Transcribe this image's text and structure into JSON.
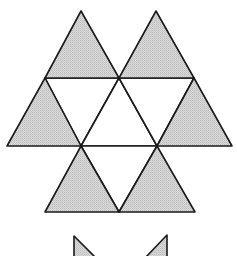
{
  "diagram": {
    "colors": {
      "shaded_fill": "#d2d2d2",
      "white_fill": "#ffffff",
      "stroke": "#1a1a1a",
      "background": "#ffffff"
    },
    "shaded_triangles": [
      {
        "name": "top-left",
        "points": "81,11 45,78 119,78"
      },
      {
        "name": "top-right",
        "points": "156,11 119,78 194,78"
      },
      {
        "name": "middle-left",
        "points": "45,78 7,146 81,146"
      },
      {
        "name": "middle-right",
        "points": "194,78 157,146 232,146"
      },
      {
        "name": "bottom-left",
        "points": "81,146 45,212 119,212"
      },
      {
        "name": "bottom-right",
        "points": "157,146 119,212 195,212"
      }
    ],
    "white_triangles": [
      {
        "name": "center-left-down",
        "points": "45,78 119,78 81,146"
      },
      {
        "name": "center-up",
        "points": "119,78 81,146 157,146"
      },
      {
        "name": "center-right-down",
        "points": "119,78 194,78 157,146"
      },
      {
        "name": "bottom-center-down",
        "points": "81,146 157,146 119,212"
      }
    ],
    "partial_shapes": [
      {
        "name": "partial-left",
        "points": "74,236 74,257 95,257"
      },
      {
        "name": "partial-right",
        "points": "167,235 167,257 146,257"
      }
    ]
  }
}
